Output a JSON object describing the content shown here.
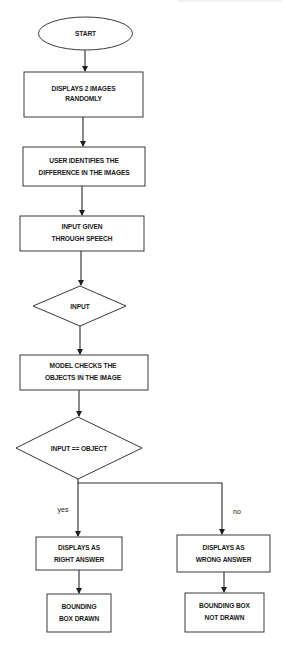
{
  "diagram": {
    "type": "flowchart",
    "colors": {
      "stroke": "#3a3a3a",
      "fill": "#ffffff",
      "text": "#1a1a1a",
      "background": "#ffffff"
    },
    "nodes": {
      "start": {
        "shape": "ellipse",
        "lines": [
          "START"
        ]
      },
      "display_images": {
        "shape": "rectangle",
        "lines": [
          "DISPLAYS 2 IMAGES",
          "RANDOMLY"
        ]
      },
      "user_identifies": {
        "shape": "rectangle",
        "lines": [
          "USER IDENTIFIES THE",
          "DIFFERENCE IN THE IMAGES"
        ]
      },
      "speech_input": {
        "shape": "rectangle",
        "lines": [
          "INPUT GIVEN",
          "THROUGH SPEECH"
        ]
      },
      "input": {
        "shape": "diamond",
        "lines": [
          "INPUT"
        ]
      },
      "model_checks": {
        "shape": "rectangle",
        "lines": [
          "MODEL CHECKS THE",
          "OBJECTS IN THE IMAGE"
        ]
      },
      "decision": {
        "shape": "diamond",
        "lines": [
          "INPUT == OBJECT"
        ]
      },
      "right_answer": {
        "shape": "rectangle",
        "lines": [
          "DISPLAYS AS",
          "RIGHT ANSWER"
        ]
      },
      "wrong_answer": {
        "shape": "rectangle",
        "lines": [
          "DISPLAYS AS",
          "WRONG ANSWER"
        ]
      },
      "box_drawn": {
        "shape": "rectangle",
        "lines": [
          "BOUNDING",
          "BOX DRAWN"
        ]
      },
      "box_not_drawn": {
        "shape": "rectangle",
        "lines": [
          "BOUNDING BOX",
          "NOT DRAWN"
        ]
      }
    },
    "edges": [
      {
        "from": "start",
        "to": "display_images",
        "label": ""
      },
      {
        "from": "display_images",
        "to": "user_identifies",
        "label": ""
      },
      {
        "from": "user_identifies",
        "to": "speech_input",
        "label": ""
      },
      {
        "from": "speech_input",
        "to": "input",
        "label": ""
      },
      {
        "from": "input",
        "to": "model_checks",
        "label": ""
      },
      {
        "from": "model_checks",
        "to": "decision",
        "label": ""
      },
      {
        "from": "decision",
        "to": "right_answer",
        "label": "yes"
      },
      {
        "from": "decision",
        "to": "wrong_answer",
        "label": "no"
      },
      {
        "from": "right_answer",
        "to": "box_drawn",
        "label": ""
      },
      {
        "from": "wrong_answer",
        "to": "box_not_drawn",
        "label": ""
      }
    ],
    "edge_labels": {
      "yes": "yes",
      "no": "no"
    }
  }
}
